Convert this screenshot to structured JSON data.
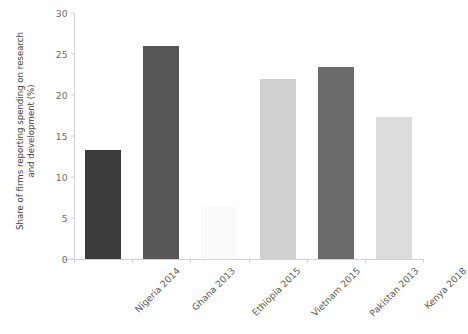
{
  "chart_data": {
    "type": "bar",
    "title": "",
    "subtitle": "",
    "xlabel": "",
    "ylabel": "Share of firms reporting spending on research and development (%)",
    "ylabel_lines": [
      "Share of firms reporting spending on research",
      "and development (%)"
    ],
    "categories": [
      "Nigeria 2014",
      "Ghana 2013",
      "Ethiopia 2015",
      "Vietnam 2015",
      "Pakistan 2013",
      "Kenya 2018"
    ],
    "values": [
      13.3,
      26.0,
      6.3,
      22.0,
      23.4,
      17.3
    ],
    "bar_colors": [
      "#3b3b3b",
      "#575757",
      "#fafafa",
      "#d1d1d1",
      "#6b6b6b",
      "#dcdcdc"
    ],
    "ylim": [
      0,
      30
    ],
    "yticks": [
      0,
      5,
      10,
      15,
      20,
      25,
      30
    ],
    "ytick_labels": [
      "0",
      "5",
      "10",
      "15",
      "20",
      "25",
      "30"
    ],
    "grid": false,
    "legend": false,
    "legend_position": "none",
    "orientation": "vertical",
    "xtick_label_rotation": -45
  },
  "axis": {
    "line_color": "#d2d2d2",
    "tick_label_color": "#6d6d6d"
  }
}
